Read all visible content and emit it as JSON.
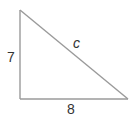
{
  "diagram": {
    "type": "right-triangle",
    "line_color": "#9a9a9a",
    "text_color": "#333333",
    "vertices": {
      "top": [
        20,
        10
      ],
      "right_angle": [
        20,
        99
      ],
      "bottom_right": [
        128,
        99
      ]
    },
    "labels": {
      "vertical_leg": "7",
      "horizontal_leg": "8",
      "hypotenuse": "c"
    }
  }
}
